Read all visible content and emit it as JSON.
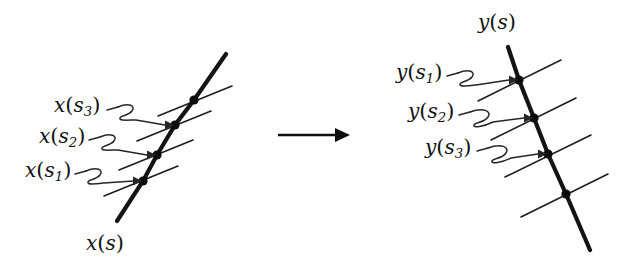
{
  "figure": {
    "title": "",
    "background_color": "#ffffff",
    "ink_color": "#111111",
    "transform_arrow": {
      "name": "maps-to-arrow",
      "direction": "right",
      "x_start": 278,
      "x_end": 349,
      "y": 135
    },
    "left_panel": {
      "name": "source-curve-panel",
      "curve_label": "x(s)",
      "curve_label_parts": {
        "fn": "x",
        "arg": "s"
      },
      "curve_orientation": "up-right",
      "point_labels": [
        {
          "fn": "x",
          "sub": "1",
          "text": "x(s_1)"
        },
        {
          "fn": "x",
          "sub": "2",
          "text": "x(s_2)"
        },
        {
          "fn": "x",
          "sub": "3",
          "text": "x(s_3)"
        }
      ],
      "labels_top_to_bottom": [
        "x(s_3)",
        "x(s_2)",
        "x(s_1)"
      ],
      "node_count": 4
    },
    "right_panel": {
      "name": "target-curve-panel",
      "curve_label": "y(s)",
      "curve_label_parts": {
        "fn": "y",
        "arg": "s"
      },
      "curve_orientation": "down-right",
      "point_labels": [
        {
          "fn": "y",
          "sub": "1",
          "text": "y(s_1)"
        },
        {
          "fn": "y",
          "sub": "2",
          "text": "y(s_2)"
        },
        {
          "fn": "y",
          "sub": "3",
          "text": "y(s_3)"
        }
      ],
      "labels_top_to_bottom": [
        "y(s_1)",
        "y(s_2)",
        "y(s_3)"
      ],
      "node_count": 4
    }
  },
  "text": {
    "x_fn": "x",
    "y_fn": "y",
    "s_var": "s",
    "paren_open": "(",
    "paren_close": ")",
    "sub1": "1",
    "sub2": "2",
    "sub3": "3"
  }
}
